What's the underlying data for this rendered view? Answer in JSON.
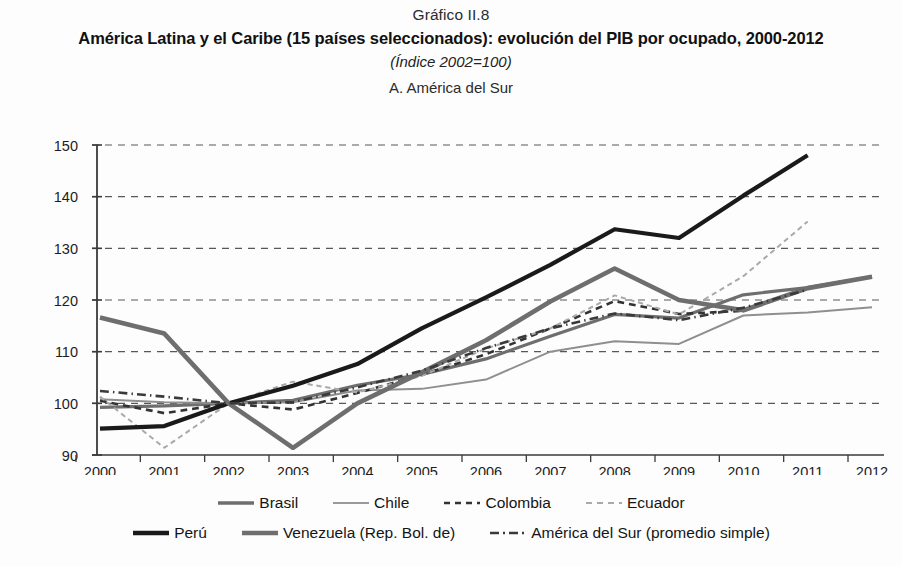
{
  "header": {
    "figure_number": "Gráfico II.8",
    "title": "América Latina y el Caribe (15 países seleccionados): evolución del PIB por ocupado, 2000-2012",
    "subtitle": "(Índice 2002=100)",
    "panel_label": "A. América del Sur"
  },
  "chart_data": {
    "type": "line",
    "title": "América Latina y el Caribe (15 países seleccionados): evolución del PIB por ocupado, 2000-2012",
    "subtitle": "(Índice 2002=100)",
    "panel": "A. América del Sur",
    "xlabel": "",
    "ylabel": "",
    "xlim": [
      2000,
      2012
    ],
    "ylim": [
      90,
      150
    ],
    "yticks": [
      90,
      100,
      110,
      120,
      130,
      140,
      150
    ],
    "grid": true,
    "grid_style": "dashed-horizontal",
    "legend_position": "bottom",
    "x": [
      2000,
      2001,
      2002,
      2003,
      2004,
      2005,
      2006,
      2007,
      2008,
      2009,
      2010,
      2011,
      2012
    ],
    "categories": [
      "2000",
      "2001",
      "2002",
      "2003",
      "2004",
      "2005",
      "2006",
      "2007",
      "2008",
      "2009",
      "2010",
      "2011",
      "2012"
    ],
    "series": [
      {
        "name": "Brasil",
        "color": "#6e6e6e",
        "style": "solid",
        "width": 3.2,
        "values": [
          99.2,
          99.5,
          100.0,
          100.6,
          103.5,
          105.6,
          108.6,
          113.0,
          117.2,
          116.5,
          121.0,
          122.4,
          124.5
        ]
      },
      {
        "name": "Chile",
        "color": "#8f8f8f",
        "style": "solid",
        "width": 2.0,
        "values": [
          100.8,
          100.2,
          100.0,
          100.2,
          102.5,
          102.8,
          104.6,
          110.0,
          112.0,
          111.5,
          117.0,
          117.6,
          118.6
        ]
      },
      {
        "name": "Colombia",
        "color": "#333333",
        "style": "dashed",
        "width": 2.6,
        "values": [
          100.5,
          98.1,
          100.0,
          98.8,
          102.0,
          105.5,
          109.5,
          114.5,
          119.8,
          117.3,
          117.9,
          122.2,
          null
        ]
      },
      {
        "name": "Ecuador",
        "color": "#a9a9a9",
        "style": "dashed",
        "width": 2.0,
        "values": [
          101.3,
          91.4,
          100.0,
          104.2,
          102.1,
          105.3,
          110.6,
          114.5,
          120.9,
          117.2,
          124.6,
          135.2,
          null
        ]
      },
      {
        "name": "Perú",
        "color": "#1a1a1a",
        "style": "solid",
        "width": 4.2,
        "values": [
          95.1,
          95.6,
          100.0,
          103.4,
          107.6,
          114.5,
          120.5,
          126.8,
          133.7,
          132.0,
          140.2,
          148.0,
          null
        ]
      },
      {
        "name": "Venezuela (Rep. Bol. de)",
        "color": "#6e6e6e",
        "style": "solid",
        "width": 4.6,
        "values": [
          116.6,
          113.5,
          100.0,
          91.4,
          100.0,
          106.0,
          112.2,
          119.7,
          126.1,
          120.0,
          118.0,
          122.3,
          124.5
        ]
      },
      {
        "name": "América del Sur (promedio simple)",
        "color": "#3a3a3a",
        "style": "dashdot",
        "width": 2.6,
        "values": [
          102.4,
          101.3,
          100.0,
          100.2,
          103.1,
          106.3,
          110.7,
          114.5,
          117.4,
          116.1,
          118.5,
          122.0,
          null
        ]
      }
    ]
  },
  "legend": {
    "row1": [
      {
        "label": "Brasil",
        "swatch": "solid",
        "color": "#6e6e6e",
        "width": 3.4
      },
      {
        "label": "Chile",
        "swatch": "solid",
        "color": "#9a9a9a",
        "width": 2.2
      },
      {
        "label": "Colombia",
        "swatch": "dashed",
        "color": "#333333",
        "width": 2.6
      },
      {
        "label": "Ecuador",
        "swatch": "dashed",
        "color": "#a9a9a9",
        "width": 2.2
      }
    ],
    "row2": [
      {
        "label": "Perú",
        "swatch": "solid",
        "color": "#1a1a1a",
        "width": 4.4
      },
      {
        "label": "Venezuela (Rep. Bol. de)",
        "swatch": "solid",
        "color": "#6e6e6e",
        "width": 4.6
      },
      {
        "label": "América del Sur (promedio simple)",
        "swatch": "dashdot",
        "color": "#3a3a3a",
        "width": 2.6
      }
    ]
  }
}
